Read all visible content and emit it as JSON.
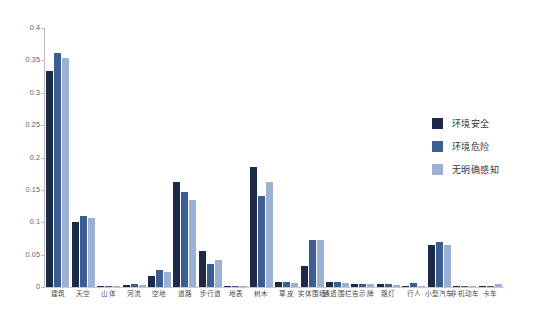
{
  "chart_data": {
    "type": "bar",
    "title": "",
    "xlabel": "",
    "ylabel": "",
    "ylim": [
      0,
      0.4
    ],
    "grid": false,
    "legend_position": "right",
    "yticks": [
      "0",
      "0.05",
      "0.1",
      "0.15",
      "0.2",
      "0.25",
      "0.3",
      "0.35",
      "0.4"
    ],
    "ytick_values": [
      0,
      0.05,
      0.1,
      0.15,
      0.2,
      0.25,
      0.3,
      0.35,
      0.4
    ],
    "categories": [
      "建筑",
      "天空",
      "山体",
      "河流",
      "空地",
      "道路",
      "步行道",
      "地表",
      "树木",
      "草皮",
      "实体围墙",
      "通透围栏",
      "告示牌",
      "路灯",
      "行人",
      "小型汽车",
      "非机动车",
      "卡车"
    ],
    "series": [
      {
        "name": "环境安全",
        "color": "#1b2a48",
        "values": [
          0.333,
          0.1,
          0.0005,
          0.003,
          0.017,
          0.162,
          0.056,
          0.0005,
          0.185,
          0.007,
          0.032,
          0.008,
          0.005,
          0.005,
          0.002,
          0.065,
          0.0015,
          0.0005
        ]
      },
      {
        "name": "环境危险",
        "color": "#3c5d92",
        "values": [
          0.361,
          0.11,
          0.0005,
          0.004,
          0.027,
          0.147,
          0.036,
          0.0005,
          0.14,
          0.008,
          0.072,
          0.007,
          0.005,
          0.004,
          0.006,
          0.07,
          0.0015,
          0.0005
        ]
      },
      {
        "name": "无明确感知",
        "color": "#9bb0d2",
        "values": [
          0.353,
          0.106,
          0.0005,
          0.003,
          0.023,
          0.135,
          0.042,
          0.0005,
          0.162,
          0.006,
          0.072,
          0.006,
          0.004,
          0.003,
          0.002,
          0.065,
          0.0015,
          0.004
        ]
      }
    ]
  },
  "legend": {
    "items": [
      {
        "label": "环境安全"
      },
      {
        "label": "环境危险"
      },
      {
        "label": "无明确感知"
      }
    ]
  }
}
